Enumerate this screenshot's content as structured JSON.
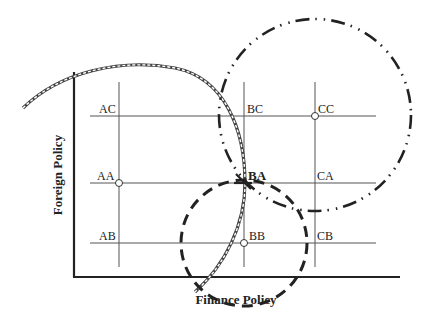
{
  "axes": {
    "x_title": "Finance Policy",
    "y_title": "Foreign Policy"
  },
  "grid": {
    "columns": [
      "A",
      "B",
      "C"
    ],
    "rows": [
      "C",
      "A",
      "B"
    ]
  },
  "nodes": [
    {
      "id": "AC",
      "label": "AC",
      "marked": false
    },
    {
      "id": "BC",
      "label": "BC",
      "marked": false
    },
    {
      "id": "CC",
      "label": "CC",
      "marked": true
    },
    {
      "id": "AA",
      "label": "AA",
      "marked": true
    },
    {
      "id": "BA",
      "label": "BA",
      "marked": false,
      "emphasis": true
    },
    {
      "id": "CA",
      "label": "CA",
      "marked": false
    },
    {
      "id": "AB",
      "label": "AB",
      "marked": false
    },
    {
      "id": "BB",
      "label": "BB",
      "marked": true
    },
    {
      "id": "CB",
      "label": "CB",
      "marked": false
    }
  ],
  "curves": [
    {
      "name": "double-line-arc",
      "style": "double-dashed"
    },
    {
      "name": "dash-dot-dot-circle",
      "style": "dash-dot-dot"
    },
    {
      "name": "bold-dashed-circle",
      "style": "bold-dashed"
    }
  ]
}
